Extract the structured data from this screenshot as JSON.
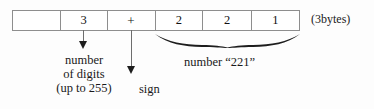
{
  "diagram": {
    "byte_box": {
      "cells": [
        {
          "label": "",
          "name": "cell-blank"
        },
        {
          "label": "3",
          "name": "cell-digit-count"
        },
        {
          "label": "+",
          "name": "cell-sign"
        },
        {
          "label": "2",
          "name": "cell-digit-1"
        },
        {
          "label": "2",
          "name": "cell-digit-2"
        },
        {
          "label": "1",
          "name": "cell-digit-3"
        }
      ],
      "size_note": "(3bytes)"
    },
    "annotations": {
      "digit_count": {
        "line1": "number",
        "line2": "of digits",
        "line3": "(up to 255)"
      },
      "sign": "sign",
      "number_value": "number “221”"
    },
    "colors": {
      "ink": "#1a1a1a",
      "rule": "#8e8e8e",
      "arrow": "#1d1d1d",
      "background": "#fdfdfd"
    }
  }
}
